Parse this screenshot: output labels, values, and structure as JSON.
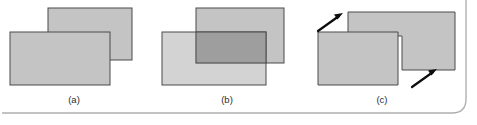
{
  "figure": {
    "name": "rectangle-boolean-operations-figure",
    "panels": [
      {
        "id": "a",
        "label": "(a)",
        "description": "two overlapping gray rectangles, front rectangle occludes back rectangle",
        "label_x": 74,
        "label_y": 103
      },
      {
        "id": "b",
        "label": "(b)",
        "description": "same two rectangles with their intersection region shaded darker",
        "label_x": 227,
        "label_y": 103
      },
      {
        "id": "c",
        "label": "(c)",
        "description": "symmetric difference: intersection removed leaving two L-shaped pieces, arrows indicate the resulting notch corners",
        "label_x": 382,
        "label_y": 103
      }
    ],
    "colors": {
      "rect_fill": "#c4c4c4",
      "rect_stroke": "#4a4a4a",
      "overlap_fill": "#9e9e9e",
      "overlap_stroke": "#4a4a4a",
      "arrow": "#0d0d0d",
      "frame_line": "#b0b0b0",
      "label_text": "#2b2b2b",
      "background": "#ffffff"
    },
    "shapes": {
      "panel_a": {
        "back_rect": {
          "x": 48,
          "y": 8,
          "w": 84,
          "h": 52
        },
        "front_rect": {
          "x": 10,
          "y": 32,
          "w": 100,
          "h": 53
        }
      },
      "panel_b": {
        "back_rect": {
          "x": 196,
          "y": 8,
          "w": 88,
          "h": 55
        },
        "front_rect": {
          "x": 162,
          "y": 32,
          "w": 104,
          "h": 53
        },
        "overlap_rect": {
          "x": 196,
          "y": 32,
          "w": 70,
          "h": 31
        }
      },
      "panel_c": {
        "upper_piece_points": "348,12 455,12 455,70 402,70 402,36 348,36",
        "lower_piece_points": "318,32 398,32 398,40 398,85 318,85"
      },
      "arrows": [
        {
          "name": "arrow-upper-left",
          "x1": 318,
          "y1": 30,
          "x2": 342,
          "y2": 14
        },
        {
          "name": "arrow-lower-right",
          "x1": 412,
          "y1": 86,
          "x2": 436,
          "y2": 70
        }
      ],
      "frame": {
        "description": "thin rounded rule along bottom edge turning up the right edge",
        "path": "M 2 113 L 452 113 Q 466 113 466 99 L 466 0"
      }
    }
  }
}
